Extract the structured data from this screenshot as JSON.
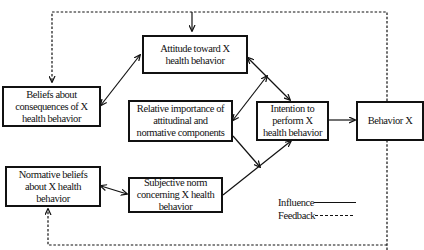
{
  "diagram": {
    "type": "flow",
    "nodes": [
      {
        "id": "attitude",
        "label": "Attitude toward X health behavior"
      },
      {
        "id": "beliefs",
        "label": "Beliefs about consequences of X health behavior"
      },
      {
        "id": "relative",
        "label": "Relative importance of attitudinal and normative components"
      },
      {
        "id": "intention",
        "label": "Intention to perform X health behavior"
      },
      {
        "id": "behavior",
        "label": "Behavior X"
      },
      {
        "id": "normative",
        "label": "Normative beliefs about X health behavior"
      },
      {
        "id": "subjective",
        "label": "Subjective norm concerning X health behavior"
      }
    ],
    "edges": [
      {
        "from": "beliefs",
        "to": "attitude",
        "style": "solid",
        "bidirectional": true
      },
      {
        "from": "attitude",
        "to": "intention",
        "style": "solid"
      },
      {
        "from": "relative",
        "to": "intention",
        "style": "solid",
        "bidirectional": true,
        "note": "connects to attitude-intention path"
      },
      {
        "from": "relative",
        "to": "intention",
        "style": "solid",
        "note": "joins subjective-intention path"
      },
      {
        "from": "normative",
        "to": "subjective",
        "style": "solid",
        "bidirectional": true
      },
      {
        "from": "subjective",
        "to": "intention",
        "style": "solid"
      },
      {
        "from": "intention",
        "to": "behavior",
        "style": "solid"
      },
      {
        "from": "behavior",
        "to": "attitude",
        "style": "dashed",
        "type": "feedback"
      },
      {
        "from": "behavior",
        "to": "beliefs",
        "style": "dashed",
        "type": "feedback"
      },
      {
        "from": "behavior",
        "to": "normative",
        "style": "dashed",
        "type": "feedback"
      }
    ]
  },
  "boxes": {
    "attitude": {
      "line1": "Attitude toward X",
      "line2": "health behavior"
    },
    "beliefs": {
      "line1": "Beliefs about",
      "line2": "consequences of X",
      "line3": "health behavior"
    },
    "relative": {
      "line1": "Relative importance of",
      "line2": "attitudinal and",
      "line3": "normative components"
    },
    "intention": {
      "line1": "Intention to",
      "line2": "perform X",
      "line3": "health behavior"
    },
    "behavior": {
      "line1": "Behavior X"
    },
    "normative": {
      "line1": "Normative beliefs",
      "line2": "about X health",
      "line3": "behavior"
    },
    "subjective": {
      "line1": "Subjective norm",
      "line2": "concerning X health",
      "line3": "behavior"
    }
  },
  "legend": {
    "influence": "Influence",
    "feedback": "Feedback"
  }
}
